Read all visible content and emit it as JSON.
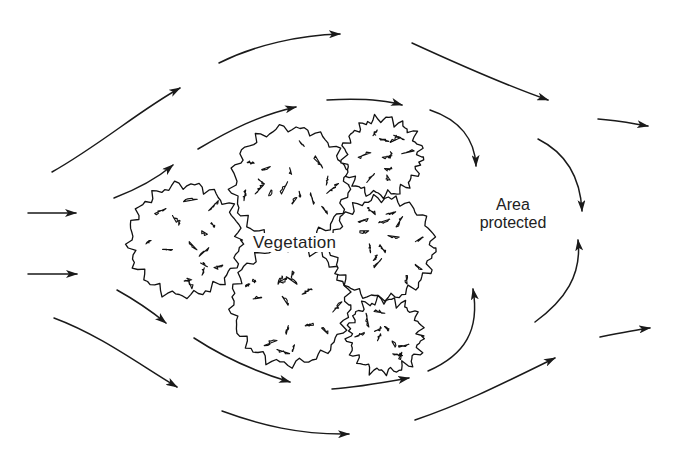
{
  "diagram": {
    "type": "flow-diagram",
    "labels": {
      "vegetation": "Vegetation",
      "area_line1": "Area",
      "area_line2": "protected"
    },
    "colors": {
      "stroke": "#1a1a1a",
      "background": "#ffffff",
      "text": "#222222"
    },
    "vegetation_clumps": [
      {
        "name": "clump-left",
        "cx": 185,
        "cy": 240,
        "r": 55
      },
      {
        "name": "clump-top-center",
        "cx": 290,
        "cy": 185,
        "r": 57
      },
      {
        "name": "clump-top-right",
        "cx": 382,
        "cy": 157,
        "r": 38
      },
      {
        "name": "clump-bottom-center",
        "cx": 290,
        "cy": 305,
        "r": 58
      },
      {
        "name": "clump-mid-right",
        "cx": 383,
        "cy": 248,
        "r": 50
      },
      {
        "name": "clump-bottom-right",
        "cx": 385,
        "cy": 336,
        "r": 36
      }
    ],
    "flow_arrows": [
      {
        "name": "arrow-inflow-upper",
        "d": "M28 213 L76 213"
      },
      {
        "name": "arrow-inflow-lower",
        "d": "M28 274 L77 274"
      },
      {
        "name": "arrow-upper-1",
        "d": "M52 172 C 100 145, 140 110, 180 88"
      },
      {
        "name": "arrow-upper-2",
        "d": "M114 198 C 135 190, 155 180, 173 165"
      },
      {
        "name": "arrow-upper-3",
        "d": "M198 149 C 230 130, 260 115, 296 107"
      },
      {
        "name": "arrow-upper-4",
        "d": "M219 63 C 255 45, 300 35, 340 34"
      },
      {
        "name": "arrow-upper-5",
        "d": "M327 100 C 365 98, 385 100, 402 105"
      },
      {
        "name": "arrow-upper-6",
        "d": "M412 43 C 460 65, 505 85, 548 100"
      },
      {
        "name": "arrow-curl-top-1",
        "d": "M430 110 C 460 120, 475 140, 476 166"
      },
      {
        "name": "arrow-curl-top-2",
        "d": "M538 139 C 560 150, 580 170, 582 211"
      },
      {
        "name": "arrow-outflow-upper",
        "d": "M598 119 C 615 120, 630 123, 648 126"
      },
      {
        "name": "arrow-lower-1",
        "d": "M117 290 C 135 300, 150 310, 166 323"
      },
      {
        "name": "arrow-lower-2",
        "d": "M54 318 C 100 335, 140 365, 177 387"
      },
      {
        "name": "arrow-lower-3",
        "d": "M194 338 C 220 355, 250 370, 290 382"
      },
      {
        "name": "arrow-lower-4",
        "d": "M222 411 C 260 425, 300 435, 349 434"
      },
      {
        "name": "arrow-lower-5",
        "d": "M332 389 C 350 388, 370 385, 409 378"
      },
      {
        "name": "arrow-curl-bottom-1",
        "d": "M428 371 C 465 355, 480 330, 473 289"
      },
      {
        "name": "arrow-curl-bottom-2",
        "d": "M535 322 C 565 300, 582 275, 578 240"
      },
      {
        "name": "arrow-lower-6",
        "d": "M415 420 C 460 405, 500 385, 555 358"
      },
      {
        "name": "arrow-outflow-lower",
        "d": "M600 337 C 620 333, 635 330, 650 328"
      }
    ]
  }
}
